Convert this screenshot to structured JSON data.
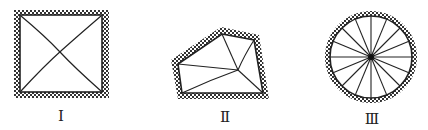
{
  "figures": [
    {
      "id": "I",
      "label": "Ⅰ",
      "shape": "square",
      "description": "Square frame with hatched border and two diagonals"
    },
    {
      "id": "II",
      "label": "Ⅱ",
      "shape": "pentagon",
      "description": "Irregular pentagon with hatched border and lines from interior point to each vertex"
    },
    {
      "id": "III",
      "label": "Ⅲ",
      "shape": "circle",
      "description": "Circle with hatched border and 16 spokes from center"
    }
  ],
  "colors": {
    "line": "#222222",
    "hatch": "#333333",
    "background": "#ffffff"
  }
}
